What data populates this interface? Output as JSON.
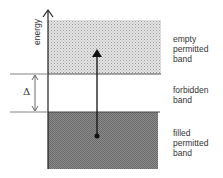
{
  "diagram": {
    "axis_label": "energy",
    "delta_label": "Δ",
    "bands": [
      {
        "id": "empty",
        "label_lines": [
          "empty",
          "permitted",
          "band"
        ],
        "fill": "#c8c8c8",
        "pattern": "light-dots"
      },
      {
        "id": "forbidden",
        "label_lines": [
          "forbidden",
          "band"
        ],
        "fill": "#ffffff"
      },
      {
        "id": "filled",
        "label_lines": [
          "filled",
          "permitted",
          "band"
        ],
        "fill": "#8a8a8a",
        "pattern": "dark-checker"
      }
    ],
    "line_color": "#222222",
    "transition": "electron excited from filled band across gap to empty band"
  }
}
